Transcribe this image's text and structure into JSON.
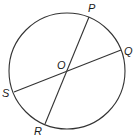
{
  "diagram": {
    "type": "circle-with-diameters",
    "circle": {
      "cx": 67,
      "cy": 71,
      "r": 58,
      "stroke": "#333333"
    },
    "center": {
      "label": "O",
      "x": 67,
      "y": 71,
      "label_x": 57,
      "label_y": 69
    },
    "points": [
      {
        "label": "P",
        "x": 89,
        "y": 17,
        "label_x": 88,
        "label_y": 12
      },
      {
        "label": "Q",
        "x": 121,
        "y": 50,
        "label_x": 124,
        "label_y": 55
      },
      {
        "label": "S",
        "x": 14,
        "y": 92,
        "label_x": 2,
        "label_y": 97
      },
      {
        "label": "R",
        "x": 45,
        "y": 124,
        "label_x": 34,
        "label_y": 135
      }
    ],
    "segments": [
      {
        "name": "PR",
        "from": "P",
        "to": "R"
      },
      {
        "name": "QS",
        "from": "Q",
        "to": "S"
      }
    ]
  }
}
